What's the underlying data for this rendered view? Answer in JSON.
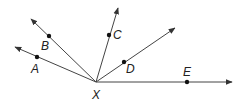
{
  "diagram": {
    "vertex": {
      "label": "X",
      "x": 96,
      "y": 82,
      "label_x": 92,
      "label_y": 99
    },
    "line_color": "#444444",
    "rays": [
      {
        "name": "A",
        "tip_x": 15,
        "tip_y": 47,
        "dot_x": 37,
        "dot_y": 57,
        "label": "A",
        "label_x": 31,
        "label_y": 73
      },
      {
        "name": "B",
        "tip_x": 31,
        "tip_y": 19,
        "dot_x": 49,
        "dot_y": 36,
        "label": "B",
        "label_x": 41,
        "label_y": 50
      },
      {
        "name": "C",
        "tip_x": 118,
        "tip_y": 8,
        "dot_x": 109,
        "dot_y": 35,
        "label": "C",
        "label_x": 113,
        "label_y": 39
      },
      {
        "name": "D",
        "tip_x": 175,
        "tip_y": 28,
        "dot_x": 124,
        "dot_y": 62,
        "label": "D",
        "label_x": 126,
        "label_y": 73
      },
      {
        "name": "E",
        "tip_x": 232,
        "tip_y": 82,
        "dot_x": 187,
        "dot_y": 82,
        "label": "E",
        "label_x": 183,
        "label_y": 76
      }
    ]
  }
}
